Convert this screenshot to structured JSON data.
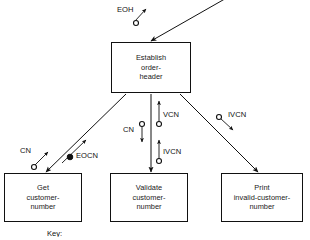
{
  "diagram": {
    "type": "data-flow-diagram",
    "key_caption": "Key:",
    "processes": [
      {
        "id": "establish",
        "lines": [
          "Establish",
          "order-",
          "header"
        ]
      },
      {
        "id": "get",
        "lines": [
          "Get",
          "customer-",
          "number"
        ]
      },
      {
        "id": "validate",
        "lines": [
          "Validate",
          "customer-",
          "number"
        ]
      },
      {
        "id": "print",
        "lines": [
          "Print",
          "invalid-customer-",
          "number"
        ]
      }
    ],
    "flows": [
      {
        "id": "eoh",
        "label": "EOH",
        "marker": "open-circle",
        "direction": "into-establish"
      },
      {
        "id": "cn-left",
        "label": "CN",
        "marker": "open-circle",
        "direction": "down-left"
      },
      {
        "id": "eocn",
        "label": "EOCN",
        "marker": "filled-circle",
        "direction": "up-right"
      },
      {
        "id": "cn-mid",
        "label": "CN",
        "marker": "open-circle",
        "direction": "down"
      },
      {
        "id": "vcn",
        "label": "VCN",
        "marker": "open-circle",
        "direction": "up"
      },
      {
        "id": "ivcn-mid",
        "label": "IVCN",
        "marker": "open-circle",
        "direction": "up"
      },
      {
        "id": "ivcn-right",
        "label": "IVCN",
        "marker": "open-circle",
        "direction": "down-right"
      }
    ],
    "colors": {
      "stroke": "#111111",
      "background": "#ffffff",
      "text": "#1a1a1a"
    }
  }
}
